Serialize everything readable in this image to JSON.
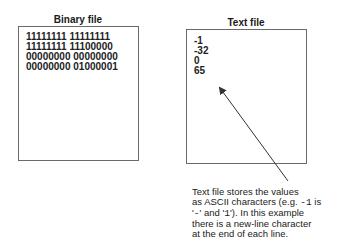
{
  "binary_panel": {
    "title": "Binary file",
    "lines": [
      "11111111 11111111",
      "11111111 11100000",
      "00000000 00000000",
      "00000000 01000001"
    ]
  },
  "text_panel": {
    "title": "Text file",
    "lines": [
      "-1",
      "-32",
      "0",
      "65"
    ]
  },
  "annotation": {
    "line1": "Text file stores the values",
    "line2_pre": "as ASCII characters (e.g. ",
    "line2_code": "-1",
    "line2_post": " is",
    "line3_pre": "'",
    "line3_code1": "-",
    "line3_mid": "' and '",
    "line3_code2": "1",
    "line3_post": "'). In this example",
    "line4": "there is a new-line character",
    "line5": "at the end of each line."
  },
  "colors": {
    "border": "#6a6a6a",
    "text": "#222222",
    "arrow": "#333333"
  }
}
